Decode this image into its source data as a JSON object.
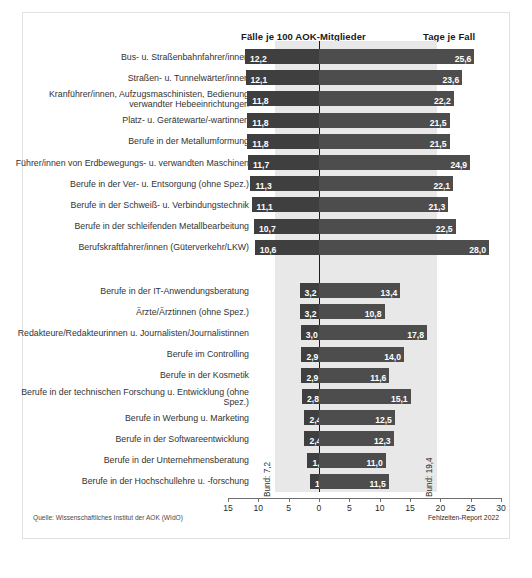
{
  "header": {
    "left_title": "Fälle je 100 AOK-Mitglieder",
    "right_title": "Tage je Fall"
  },
  "footer": {
    "source": "Quelle: Wissenschaftliches Institut der AOK (WIdO)",
    "report": "Fehlzeiten-Report 2022"
  },
  "reference": {
    "left_label": "Bund: 7,2",
    "right_label": "Bund: 19,4",
    "left_value": 7.2,
    "right_value": 19.4
  },
  "chart_data": {
    "type": "bar",
    "title": "",
    "subtitle": "",
    "orientation": "horizontal-bidirectional",
    "xlabel_left": "Fälle je 100 AOK-Mitglieder",
    "xlabel_right": "Tage je Fall",
    "ylabel": "",
    "grid": false,
    "legend_position": "none",
    "axis_ticks": [
      15,
      10,
      5,
      0,
      5,
      10,
      15,
      20,
      25,
      30
    ],
    "xlim_left": [
      0,
      15
    ],
    "xlim_right": [
      0,
      30
    ],
    "reference_band": [
      7.2,
      19.4
    ],
    "categories": [
      "Bus- u. Straßenbahnfahrer/innen",
      "Straßen- u. Tunnelwärter/innen",
      "Kranführer/innen, Aufzugsmaschinisten, Bedienung verwandter Hebeeinrichtungen",
      "Platz- u. Gerätewarte/-wartinnen",
      "Berufe in der Metallumformung",
      "Führer/innen von Erdbewegungs- u. verwandten Maschinen",
      "Berufe in der Ver- u. Entsorgung (ohne Spez.)",
      "Berufe in der Schweiß- u. Verbindungstechnik",
      "Berufe in der schleifenden Metallbearbeitung",
      "Berufskraftfahrer/innen (Güterverkehr/LKW)",
      "Berufe in der IT-Anwendungsberatung",
      "Ärzte/Ärztinnen (ohne Spez.)",
      "Redakteure/Redakteurinnen u. Journalisten/Journalistinnen",
      "Berufe im Controlling",
      "Berufe in der Kosmetik",
      "Berufe in der technischen Forschung u. Entwicklung (ohne Spez.)",
      "Berufe in Werbung u. Marketing",
      "Berufe in der Softwareentwicklung",
      "Berufe in der Unternehmensberatung",
      "Berufe in der Hochschullehre u. -forschung"
    ],
    "series": [
      {
        "name": "Fälle je 100 AOK-Mitglieder",
        "direction": "left",
        "values": [
          12.2,
          12.1,
          11.8,
          11.8,
          11.8,
          11.7,
          11.3,
          11.1,
          10.7,
          10.6,
          3.2,
          3.2,
          3.0,
          2.9,
          2.9,
          2.8,
          2.4,
          2.4,
          1.9,
          1.5
        ],
        "labels": [
          "12,2",
          "12,1",
          "11,8",
          "11,8",
          "11,8",
          "11,7",
          "11,3",
          "11,1",
          "10,7",
          "10,6",
          "3,2",
          "3,2",
          "3,0",
          "2,9",
          "2,9",
          "2,8",
          "2,4",
          "2,4",
          "1,9",
          "1,5"
        ]
      },
      {
        "name": "Tage je Fall",
        "direction": "right",
        "values": [
          25.6,
          23.6,
          22.2,
          21.5,
          21.5,
          24.9,
          22.1,
          21.3,
          22.5,
          28.0,
          13.4,
          10.8,
          17.8,
          14.0,
          11.6,
          15.1,
          12.5,
          12.3,
          11.0,
          11.5
        ],
        "labels": [
          "25,6",
          "23,6",
          "22,2",
          "21,5",
          "21,5",
          "24,9",
          "22,1",
          "21,3",
          "22,5",
          "28,0",
          "13,4",
          "10,8",
          "17,8",
          "14,0",
          "11,6",
          "15,1",
          "12,5",
          "12,3",
          "11,0",
          "11,5"
        ]
      }
    ],
    "group_gap_after_index": 9
  }
}
